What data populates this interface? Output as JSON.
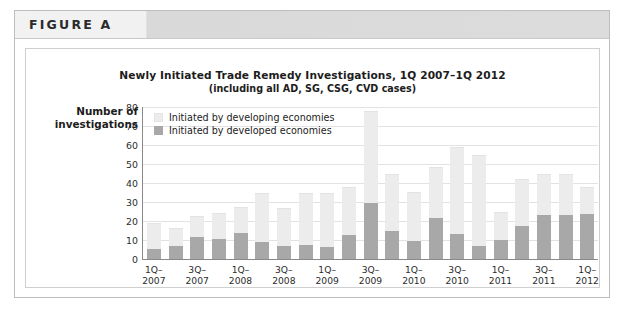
{
  "figure": {
    "label": "FIGURE A"
  },
  "chart_data": {
    "type": "bar",
    "stacked": true,
    "title": "Newly Initiated Trade Remedy Investigations, 1Q 2007–1Q 2012",
    "subtitle": "(including all AD, SG, CSG, CVD cases)",
    "ylabel": "Number of\ninvestigations",
    "ylabel_line1": "Number of",
    "ylabel_line2": "investigations",
    "xlabel": "",
    "ylim": [
      0,
      80
    ],
    "yticks": [
      0,
      10,
      20,
      30,
      40,
      50,
      60,
      70,
      80
    ],
    "grid": true,
    "legend_position": "top-left",
    "categories": [
      "1Q-2007",
      "2Q-2007",
      "3Q-2007",
      "4Q-2007",
      "1Q-2008",
      "2Q-2008",
      "3Q-2008",
      "4Q-2008",
      "1Q-2009",
      "2Q-2009",
      "3Q-2009",
      "4Q-2009",
      "1Q-2010",
      "2Q-2010",
      "3Q-2010",
      "4Q-2010",
      "1Q-2011",
      "2Q-2011",
      "3Q-2011",
      "4Q-2011",
      "1Q-2012"
    ],
    "xtick_labels": [
      {
        "index": 0,
        "line1": "1Q–",
        "line2": "2007"
      },
      {
        "index": 2,
        "line1": "3Q–",
        "line2": "2007"
      },
      {
        "index": 4,
        "line1": "1Q–",
        "line2": "2008"
      },
      {
        "index": 6,
        "line1": "3Q–",
        "line2": "2008"
      },
      {
        "index": 8,
        "line1": "1Q–",
        "line2": "2009"
      },
      {
        "index": 10,
        "line1": "3Q–",
        "line2": "2009"
      },
      {
        "index": 12,
        "line1": "1Q–",
        "line2": "2010"
      },
      {
        "index": 14,
        "line1": "3Q–",
        "line2": "2010"
      },
      {
        "index": 16,
        "line1": "1Q–",
        "line2": "2011"
      },
      {
        "index": 18,
        "line1": "3Q–",
        "line2": "2011"
      },
      {
        "index": 20,
        "line1": "1Q–",
        "line2": "2012"
      }
    ],
    "series": [
      {
        "name": "Initiated by developed economies",
        "color": "#a8a8a8",
        "values": [
          5.5,
          7,
          11.5,
          10.5,
          13.5,
          9,
          7,
          7.5,
          6.5,
          12.5,
          29.5,
          14.5,
          9.5,
          21.5,
          13,
          7,
          10,
          17.5,
          23,
          23,
          23.5
        ]
      },
      {
        "name": "Initiated by developing economies",
        "color": "#ececec",
        "values": [
          13.5,
          9.5,
          11,
          13.5,
          14,
          26,
          20,
          27.5,
          28.5,
          25.5,
          48.5,
          30.5,
          26,
          27,
          46,
          48,
          14.5,
          24.5,
          22,
          22,
          14.5
        ]
      }
    ],
    "totals": [
      19,
      16.5,
      22.5,
      24,
      27.5,
      35,
      27,
      35,
      35,
      38,
      78,
      45,
      35.5,
      48.5,
      59,
      55,
      24.5,
      42,
      45,
      45,
      38
    ]
  }
}
